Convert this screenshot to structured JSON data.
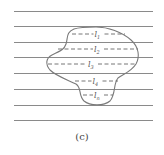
{
  "figure": {
    "caption": "(c)",
    "line_color": "#8a8a8a",
    "outline_color": "#7a7a7a",
    "parallel_lines_y": [
      11,
      26,
      42,
      57,
      73,
      89,
      105,
      120
    ],
    "chords": [
      {
        "label": "l",
        "sub": "1",
        "y": 34,
        "x1": 72,
        "x2": 125
      },
      {
        "label": "l",
        "sub": "2",
        "y": 49,
        "x1": 58,
        "x2": 138
      },
      {
        "label": "l",
        "sub": "3",
        "y": 64,
        "x1": 48,
        "x2": 136
      },
      {
        "label": "l",
        "sub": "4",
        "y": 81,
        "x1": 75,
        "x2": 118
      },
      {
        "label": "l",
        "sub": "n",
        "y": 95,
        "x1": 83,
        "x2": 113
      }
    ]
  }
}
